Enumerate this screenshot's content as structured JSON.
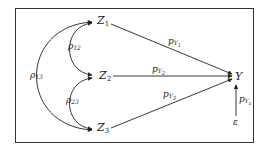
{
  "diagram": {
    "type": "path-diagram",
    "nodes": {
      "z1": {
        "name": "Z",
        "sub": "1"
      },
      "z2": {
        "name": "Z",
        "sub": "2"
      },
      "z3": {
        "name": "Z",
        "sub": "3"
      },
      "y": {
        "name": "Y"
      },
      "eps": {
        "name": "ε"
      }
    },
    "correlations": {
      "r12": {
        "symbol": "ρ",
        "sub": "12"
      },
      "r23": {
        "symbol": "ρ",
        "sub": "23"
      },
      "r13": {
        "symbol": "ρ",
        "sub": "13"
      }
    },
    "paths": {
      "py1": {
        "symbol": "p",
        "sub": "Y",
        "subsub": "1"
      },
      "py2": {
        "symbol": "p",
        "sub": "Y",
        "subsub": "2"
      },
      "py3": {
        "symbol": "p",
        "sub": "Y",
        "subsub": "3"
      },
      "pye": {
        "symbol": "p",
        "sub": "Y",
        "subsub": "ε"
      }
    },
    "colors": {
      "stroke": "#222222",
      "border": "#333333"
    }
  }
}
